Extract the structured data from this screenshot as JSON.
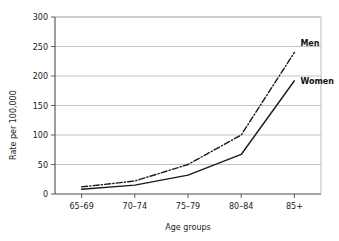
{
  "chart_data": {
    "type": "line",
    "title": "",
    "xlabel": "Age groups",
    "ylabel": "Rate per 100,000",
    "categories": [
      "65–69",
      "70–74",
      "75–79",
      "80–84",
      "85+"
    ],
    "series": [
      {
        "name": "Men",
        "values": [
          12,
          22,
          50,
          100,
          240
        ],
        "style": "dash-dot",
        "color": "#1a1a1a"
      },
      {
        "name": "Women",
        "values": [
          8,
          15,
          32,
          67,
          192
        ],
        "style": "solid",
        "color": "#1a1a1a"
      }
    ],
    "ylim": [
      0,
      300
    ],
    "yticks": [
      0,
      50,
      100,
      150,
      200,
      250,
      300
    ],
    "ytick_labels": [
      "0",
      "50",
      "100",
      "150",
      "200",
      "250",
      "300"
    ],
    "grid": true,
    "grid_axis": "y",
    "legend": "inline-right",
    "legend_entries": [
      "Men",
      "Women"
    ]
  },
  "axes": {
    "y_title": "Rate per 100,000",
    "x_title": "Age groups"
  },
  "colors": {
    "line": "#1a1a1a",
    "grid": "#b4b4b4",
    "axis": "#4d4d4d",
    "background": "#ffffff",
    "text": "#1a1a1a"
  },
  "labels": {
    "men": "Men",
    "women": "Women"
  }
}
